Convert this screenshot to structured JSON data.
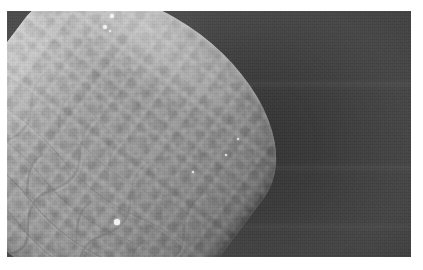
{
  "figure": {
    "domain": "Natural-Image",
    "kind": "scanning-electron-micrograph",
    "caption": "",
    "canvas": {
      "width": 423,
      "height": 270,
      "background_color": "#ffffff"
    },
    "plate": {
      "left": 7,
      "top": 11,
      "width": 404,
      "height": 246,
      "border": "none",
      "background_color": "#4a4a4a"
    }
  },
  "palette": {
    "page_white": "#ffffff",
    "background_gray": "#4a4a4a",
    "background_gray_light": "#4e4e4e",
    "background_gray_dark": "#414141",
    "shadow_gray": "#363636",
    "specimen_highlight": "#d6d6d6",
    "specimen_mid": "#a5a5a5",
    "specimen_shade": "#8a8a8a",
    "specimen_edge_dark": "#7e7e7e",
    "speck_white": "#f2f2f2"
  },
  "subject": {
    "name": "specimen-tip",
    "description": "rounded, club-shaped apical end of an elongate body",
    "orientation_degrees": 37,
    "surface": "finely mottled cuticle with polygonal cell reticulation toward the basal end",
    "apex_position": {
      "x": 0.28,
      "y": 0.06
    },
    "long_axis": "upper-left to lower-right"
  },
  "annotations": {
    "scale_bar": null,
    "labels": [],
    "text_overlays": []
  },
  "specks": [
    {
      "name": "debris-speck-apex-1",
      "x": 112,
      "y": 16,
      "r": 1.6
    },
    {
      "name": "debris-speck-apex-2",
      "x": 105,
      "y": 27,
      "r": 2.1
    },
    {
      "name": "debris-speck-apex-3",
      "x": 110,
      "y": 31,
      "r": 1.2
    },
    {
      "name": "debris-speck-rim-left",
      "x": 117,
      "y": 222,
      "r": 2.6
    },
    {
      "name": "debris-speck-mid-1",
      "x": 238,
      "y": 139,
      "r": 1.3
    },
    {
      "name": "debris-speck-mid-2",
      "x": 226,
      "y": 155,
      "r": 1.1
    },
    {
      "name": "debris-speck-mid-3",
      "x": 193,
      "y": 172,
      "r": 1.2
    }
  ],
  "cell_reticulation": {
    "description": "network of irregular polygonal epidermal cells most visible along the lower-right flank",
    "cell_count_visible": 24,
    "line_color": "#6f6f6f"
  }
}
